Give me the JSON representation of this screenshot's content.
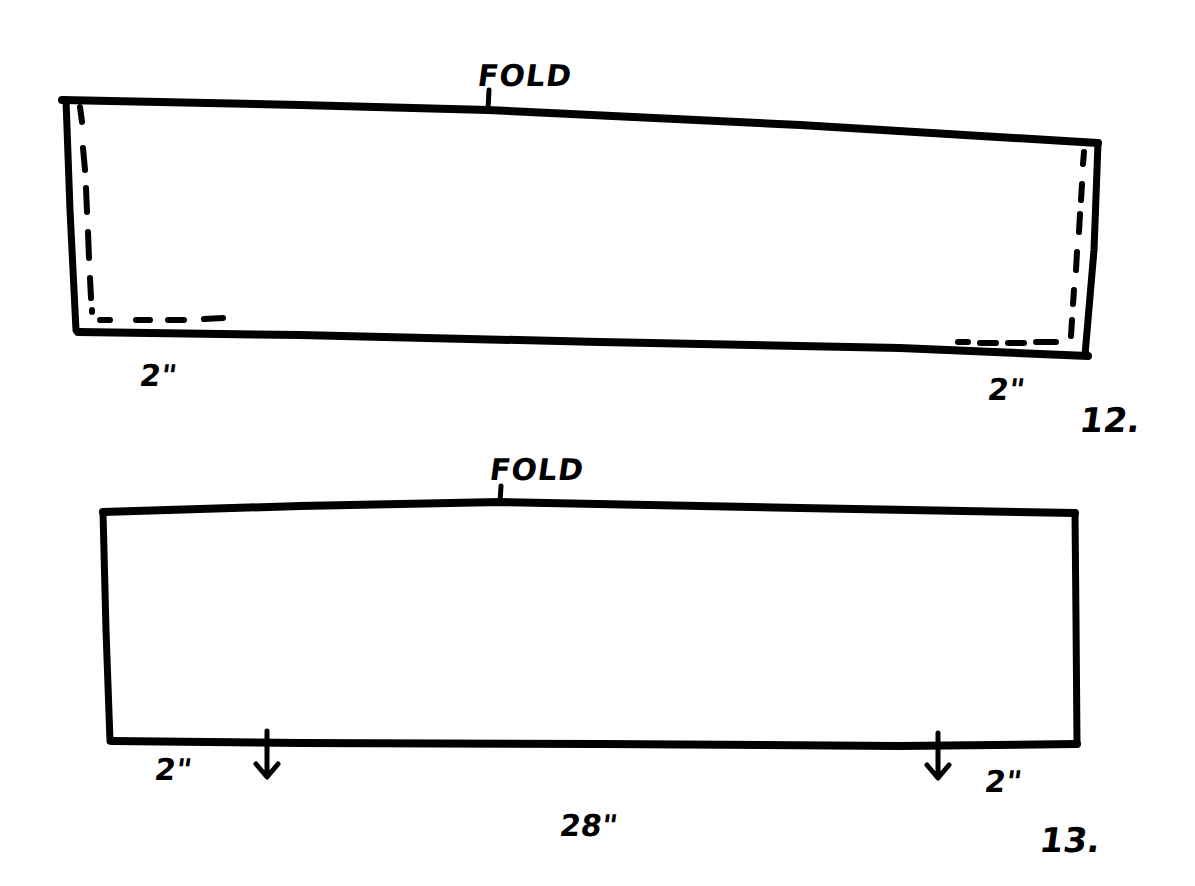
{
  "figures": [
    {
      "step": "12.",
      "fold_label": "FOLD",
      "left_measure": "2\"",
      "right_measure": "2\"",
      "stitch_lines": "dashed at left and right ends with 2\" bottom returns"
    },
    {
      "step": "13.",
      "fold_label": "FOLD",
      "left_measure": "2\"",
      "right_measure": "2\"",
      "width_measure": "28\"",
      "markers": [
        "down-arrow at 2\" from left",
        "down-arrow at 2\" from right"
      ]
    }
  ],
  "colors": {
    "ink": "#000000",
    "paper": "#ffffff"
  }
}
